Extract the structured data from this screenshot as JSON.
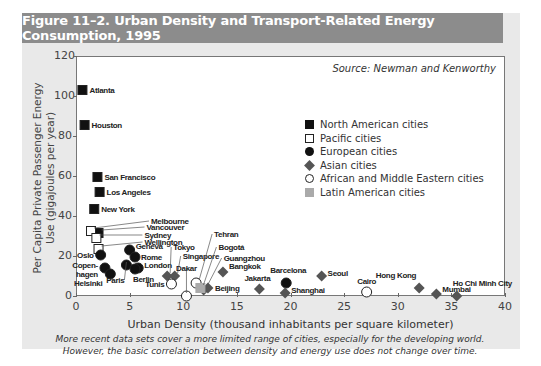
{
  "header": {
    "title": "Figure 11–2. Urban Density and Transport-Related Energy Consumption, 1995"
  },
  "source": "Source: Newman and Kenworthy",
  "caption": {
    "line1": "More recent data sets cover a more limited range of cities, especially for the developing world.",
    "line2": "However, the basic correlation between density and energy use does not change over time."
  },
  "colors": {
    "header_bg": "#8c8c8c",
    "panel_bg": "#e9e9e9",
    "asian": "#555555",
    "latin_american": "#aaaaaa",
    "north_american": "#111111"
  },
  "chart_data": {
    "type": "scatter",
    "title": "Figure 11–2. Urban Density and Transport-Related Energy Consumption, 1995",
    "xlabel": "Urban Density (thousand inhabitants per square kilometer)",
    "ylabel": "Per Capita Private Passenger Energy Use (gigajoules per year)",
    "xlim": [
      0,
      40
    ],
    "ylim": [
      0,
      120
    ],
    "xticks": [
      "0",
      "5",
      "10",
      "15",
      "20",
      "25",
      "30",
      "35",
      "40"
    ],
    "yticks": [
      "0",
      "20",
      "40",
      "60",
      "80",
      "100",
      "120"
    ],
    "grid": false,
    "legend": [
      {
        "key": "na",
        "label": "North American cities"
      },
      {
        "key": "pac",
        "label": "Pacific cities"
      },
      {
        "key": "eu",
        "label": "European cities"
      },
      {
        "key": "as",
        "label": "Asian cities"
      },
      {
        "key": "af",
        "label": "African and Middle Eastern cities"
      },
      {
        "key": "la",
        "label": "Latin American cities"
      }
    ],
    "legend_position": "upper right",
    "annotation": "Source: Newman and Kenworthy",
    "series": [
      {
        "name": "North American cities",
        "points": [
          {
            "city": "Atlanta",
            "x": 0.6,
            "y": 103
          },
          {
            "city": "Houston",
            "x": 0.8,
            "y": 85.5
          },
          {
            "city": "San Francisco",
            "x": 2.0,
            "y": 59.5
          },
          {
            "city": "Los Angeles",
            "x": 2.2,
            "y": 52
          },
          {
            "city": "New York",
            "x": 1.7,
            "y": 43.5
          },
          {
            "city": "Vancouver",
            "x": 2.1,
            "y": 31.5
          }
        ]
      },
      {
        "name": "Pacific cities",
        "points": [
          {
            "city": "Melbourne",
            "x": 1.4,
            "y": 32.5
          },
          {
            "city": "Sydney",
            "x": 1.9,
            "y": 29
          },
          {
            "city": "Wellington",
            "x": 2.1,
            "y": 23.5
          }
        ]
      },
      {
        "name": "European cities",
        "points": [
          {
            "city": "Oslo",
            "x": 2.3,
            "y": 20.5
          },
          {
            "city": "Copenhagen",
            "x": 2.7,
            "y": 14
          },
          {
            "city": "Helsinki",
            "x": 3.2,
            "y": 11
          },
          {
            "city": "Geneva",
            "x": 5.0,
            "y": 23
          },
          {
            "city": "Rome",
            "x": 5.5,
            "y": 19.5
          },
          {
            "city": "Paris",
            "x": 4.7,
            "y": 15.5
          },
          {
            "city": "London",
            "x": 5.8,
            "y": 14
          },
          {
            "city": "Berlin",
            "x": 5.5,
            "y": 13.5
          },
          {
            "city": "Barcelona",
            "x": 19.6,
            "y": 6.5
          }
        ]
      },
      {
        "name": "Asian cities",
        "points": [
          {
            "city": "Tokyo",
            "x": 8.5,
            "y": 10
          },
          {
            "city": "Singapore",
            "x": 9.2,
            "y": 10
          },
          {
            "city": "Guangzhou",
            "x": 11.9,
            "y": 3
          },
          {
            "city": "Beijing",
            "x": 12.3,
            "y": 4
          },
          {
            "city": "Bangkok",
            "x": 13.7,
            "y": 12
          },
          {
            "city": "Jakarta",
            "x": 17.1,
            "y": 3.5
          },
          {
            "city": "Shanghai",
            "x": 19.5,
            "y": 1.5
          },
          {
            "city": "Seoul",
            "x": 22.9,
            "y": 10
          },
          {
            "city": "Hong Kong",
            "x": 32.0,
            "y": 4
          },
          {
            "city": "Mumbai",
            "x": 33.6,
            "y": 1
          },
          {
            "city": "Ho Chi Minh City",
            "x": 35.5,
            "y": 0
          }
        ]
      },
      {
        "name": "African and Middle Eastern cities",
        "points": [
          {
            "city": "Tunis",
            "x": 8.9,
            "y": 6
          },
          {
            "city": "Dakar",
            "x": 10.3,
            "y": 0
          },
          {
            "city": "Tehran",
            "x": 11.2,
            "y": 6.5
          },
          {
            "city": "Cairo",
            "x": 27.1,
            "y": 2
          }
        ]
      },
      {
        "name": "Latin American cities",
        "points": [
          {
            "city": "Bogotá",
            "x": 11.6,
            "y": 4
          }
        ]
      }
    ]
  }
}
